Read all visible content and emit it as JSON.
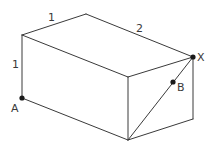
{
  "diagram": {
    "vertices": {
      "top_left_front": [
        22,
        35
      ],
      "top_back_left": [
        86,
        14
      ],
      "top_back_right": [
        193,
        57
      ],
      "top_front_right": [
        128,
        77
      ],
      "bottom_left_front": [
        22,
        98
      ],
      "bottom_front_right": [
        128,
        140
      ],
      "bottom_back_right": [
        193,
        119
      ]
    },
    "points": [
      {
        "name": "A",
        "label": "A",
        "x": 22,
        "y": 98
      },
      {
        "name": "B",
        "label": "B",
        "x": 173,
        "y": 82
      },
      {
        "name": "X",
        "label": "X",
        "x": 193,
        "y": 57
      }
    ],
    "dimension_labels": {
      "top_width": "1",
      "top_length": "2",
      "height": "1"
    },
    "point_labels": {
      "a": "A",
      "b": "B",
      "x": "X"
    },
    "colors": {
      "line": "#3a3a3a",
      "point": "#1a1a1a",
      "background": "#ffffff"
    }
  }
}
